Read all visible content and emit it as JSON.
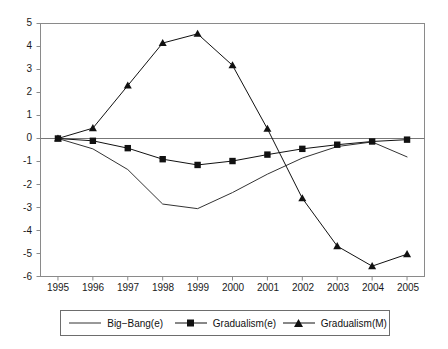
{
  "chart_data": {
    "type": "line",
    "title": "",
    "subtitle": "",
    "xlabel": "",
    "ylabel": "",
    "categories": [
      "1995",
      "1996",
      "1997",
      "1998",
      "1999",
      "2000",
      "2001",
      "2002",
      "2003",
      "2004",
      "2005"
    ],
    "x": [
      1995,
      1996,
      1997,
      1998,
      1999,
      2000,
      2001,
      2002,
      2003,
      2004,
      2005
    ],
    "xlim": [
      1995,
      2005
    ],
    "ylim": [
      -6,
      5
    ],
    "yticks": [
      "5",
      "4",
      "3",
      "2",
      "1",
      "0",
      "-1",
      "-2",
      "-3",
      "-4",
      "-5",
      "-6"
    ],
    "ytick_values": [
      5,
      4,
      3,
      2,
      1,
      0,
      -1,
      -2,
      -3,
      -4,
      -5,
      -6
    ],
    "grid": false,
    "zero_line": true,
    "legend_position": "bottom",
    "series": [
      {
        "name": "Big−Bang(e)",
        "marker": "none",
        "color": "#333333",
        "values": [
          0.0,
          -0.45,
          -1.35,
          -2.85,
          -3.05,
          -2.35,
          -1.55,
          -0.85,
          -0.35,
          -0.15,
          -0.8
        ]
      },
      {
        "name": "Gradualism(e)",
        "marker": "square",
        "color": "#111111",
        "values": [
          0.0,
          -0.1,
          -0.42,
          -0.9,
          -1.15,
          -0.98,
          -0.7,
          -0.45,
          -0.27,
          -0.13,
          -0.05
        ]
      },
      {
        "name": "Gradualism(M)",
        "marker": "triangle",
        "color": "#111111",
        "values": [
          0.0,
          0.45,
          2.3,
          4.15,
          4.55,
          3.18,
          0.42,
          -2.6,
          -4.68,
          -5.55,
          -5.03
        ]
      }
    ]
  },
  "legend": {
    "entries": [
      {
        "label": "Big−Bang(e)",
        "marker": "none"
      },
      {
        "label": "Gradualism(e)",
        "marker": "square"
      },
      {
        "label": "Gradualism(M)",
        "marker": "triangle"
      }
    ]
  }
}
